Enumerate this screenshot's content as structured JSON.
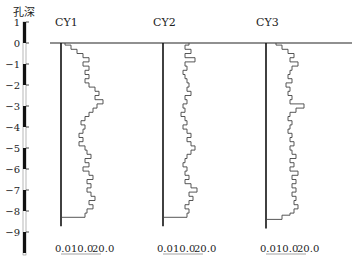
{
  "chart_data": {
    "type": "line",
    "title": "",
    "ylabel": "孔深",
    "depth_axis": {
      "ticks": [
        1,
        0,
        -1,
        -2,
        -3,
        -4,
        -5,
        -6,
        -7,
        -8,
        -9
      ],
      "range": [
        1,
        -10
      ],
      "bar_pattern": "alternating black/white per 1 unit, black from 1 to 0"
    },
    "xlabel_ticks": [
      "0.0",
      "10.0",
      "20.0"
    ],
    "xlim": [
      0,
      20
    ],
    "panels": [
      {
        "name": "CY1",
        "bottom_depth": -8.3,
        "profile": [
          [
            0.0,
            2
          ],
          [
            -0.1,
            5
          ],
          [
            -0.3,
            8
          ],
          [
            -0.5,
            11
          ],
          [
            -0.7,
            14
          ],
          [
            -0.9,
            11
          ],
          [
            -1.1,
            14
          ],
          [
            -1.3,
            12
          ],
          [
            -1.5,
            14
          ],
          [
            -1.7,
            12
          ],
          [
            -1.9,
            14
          ],
          [
            -2.1,
            17
          ],
          [
            -2.3,
            19
          ],
          [
            -2.5,
            17
          ],
          [
            -2.7,
            21
          ],
          [
            -2.9,
            18
          ],
          [
            -3.1,
            16
          ],
          [
            -3.3,
            14
          ],
          [
            -3.5,
            12
          ],
          [
            -3.7,
            10
          ],
          [
            -3.9,
            12
          ],
          [
            -4.1,
            11
          ],
          [
            -4.3,
            9
          ],
          [
            -4.5,
            11
          ],
          [
            -4.7,
            9
          ],
          [
            -4.9,
            12
          ],
          [
            -5.1,
            13
          ],
          [
            -5.3,
            15
          ],
          [
            -5.5,
            12
          ],
          [
            -5.7,
            14
          ],
          [
            -5.9,
            11
          ],
          [
            -6.1,
            14
          ],
          [
            -6.3,
            16
          ],
          [
            -6.5,
            13
          ],
          [
            -6.7,
            15
          ],
          [
            -6.9,
            13
          ],
          [
            -7.1,
            15
          ],
          [
            -7.3,
            17
          ],
          [
            -7.5,
            14
          ],
          [
            -7.7,
            16
          ],
          [
            -7.9,
            13
          ],
          [
            -8.1,
            12
          ]
        ]
      },
      {
        "name": "CY2",
        "bottom_depth": -8.3,
        "profile": [
          [
            0.0,
            13
          ],
          [
            -0.1,
            11
          ],
          [
            -0.3,
            14
          ],
          [
            -0.5,
            11
          ],
          [
            -0.7,
            16
          ],
          [
            -0.9,
            11
          ],
          [
            -1.1,
            12
          ],
          [
            -1.3,
            10
          ],
          [
            -1.5,
            11
          ],
          [
            -1.7,
            12
          ],
          [
            -1.9,
            13
          ],
          [
            -2.1,
            12
          ],
          [
            -2.3,
            14
          ],
          [
            -2.5,
            11
          ],
          [
            -2.7,
            12
          ],
          [
            -2.9,
            10
          ],
          [
            -3.1,
            11
          ],
          [
            -3.3,
            9
          ],
          [
            -3.5,
            11
          ],
          [
            -3.7,
            12
          ],
          [
            -3.9,
            10
          ],
          [
            -4.1,
            12
          ],
          [
            -4.3,
            14
          ],
          [
            -4.5,
            12
          ],
          [
            -4.7,
            14
          ],
          [
            -4.9,
            16
          ],
          [
            -5.1,
            14
          ],
          [
            -5.3,
            12
          ],
          [
            -5.5,
            11
          ],
          [
            -5.7,
            10
          ],
          [
            -5.9,
            12
          ],
          [
            -6.1,
            11
          ],
          [
            -6.3,
            13
          ],
          [
            -6.5,
            11
          ],
          [
            -6.7,
            14
          ],
          [
            -6.9,
            17
          ],
          [
            -7.1,
            13
          ],
          [
            -7.3,
            15
          ],
          [
            -7.5,
            13
          ],
          [
            -7.7,
            11
          ],
          [
            -7.9,
            13
          ],
          [
            -8.1,
            12
          ]
        ]
      },
      {
        "name": "CY3",
        "bottom_depth": -8.4,
        "profile": [
          [
            0.0,
            5
          ],
          [
            -0.1,
            8
          ],
          [
            -0.3,
            11
          ],
          [
            -0.5,
            14
          ],
          [
            -0.7,
            12
          ],
          [
            -0.9,
            16
          ],
          [
            -1.1,
            13
          ],
          [
            -1.3,
            12
          ],
          [
            -1.5,
            11
          ],
          [
            -1.7,
            13
          ],
          [
            -1.9,
            10
          ],
          [
            -2.1,
            12
          ],
          [
            -2.3,
            11
          ],
          [
            -2.5,
            13
          ],
          [
            -2.7,
            12
          ],
          [
            -2.9,
            19
          ],
          [
            -3.1,
            15
          ],
          [
            -3.3,
            12
          ],
          [
            -3.5,
            11
          ],
          [
            -3.7,
            13
          ],
          [
            -3.9,
            12
          ],
          [
            -4.1,
            11
          ],
          [
            -4.3,
            13
          ],
          [
            -4.5,
            12
          ],
          [
            -4.7,
            14
          ],
          [
            -4.9,
            12
          ],
          [
            -5.1,
            13
          ],
          [
            -5.3,
            15
          ],
          [
            -5.5,
            12
          ],
          [
            -5.7,
            14
          ],
          [
            -5.9,
            12
          ],
          [
            -6.1,
            16
          ],
          [
            -6.3,
            13
          ],
          [
            -6.5,
            15
          ],
          [
            -6.7,
            13
          ],
          [
            -6.9,
            15
          ],
          [
            -7.1,
            13
          ],
          [
            -7.3,
            15
          ],
          [
            -7.5,
            14
          ],
          [
            -7.7,
            16
          ],
          [
            -7.9,
            14
          ],
          [
            -8.1,
            12
          ],
          [
            -8.2,
            8
          ]
        ]
      }
    ],
    "grid": false,
    "legend": null
  },
  "labels": {
    "depth_title": "孔深",
    "panel_titles": [
      "CY1",
      "CY2",
      "CY3"
    ],
    "x_tick_0": "0.0",
    "x_tick_10": "10.0",
    "x_tick_20": "20.0"
  }
}
